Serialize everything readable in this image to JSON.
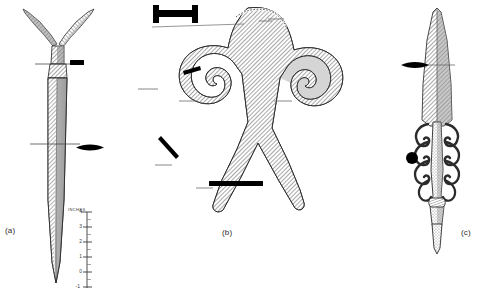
{
  "plate": {
    "title": "Archaeological artefact plate: antenna-hilted daggers",
    "background_color": "#ffffff",
    "ink_color": "#2b2b2b",
    "width": 477,
    "height": 297
  },
  "figures": [
    {
      "id": "a",
      "label": "(a)",
      "name": "antenna-hilted-dagger",
      "description": "Long tapering dagger blade with Y-shaped antenna hilt, hatched shading"
    },
    {
      "id": "b",
      "label": "(b)",
      "name": "double-spiral-antennae-hilt",
      "description": "Broad hilt plate with two inward volutes and two splayed tangs, hatched shading"
    },
    {
      "id": "c",
      "label": "(c)",
      "name": "openwork-ornate-dagger",
      "description": "Narrow blade with symmetrical openwork scroll ornament along the grip"
    }
  ],
  "cross_sections": [
    {
      "name": "rectangular-bar",
      "shape": "rectangle",
      "figure": "a",
      "note": "flat rectangular section at hilt junction"
    },
    {
      "name": "lenticular",
      "shape": "lens",
      "figure": "a",
      "note": "lens-shaped blade section"
    },
    {
      "name": "i-beam",
      "shape": "dumbbell",
      "figure": "b",
      "note": "I-shaped / dumbbell section of the hilt plate"
    },
    {
      "name": "short-angled-bar",
      "shape": "angled-bar",
      "figure": "b",
      "note": "thin angled bar section at volute"
    },
    {
      "name": "diagonal-bar",
      "shape": "diagonal-line",
      "figure": "b",
      "note": "slender diagonal section at tang"
    },
    {
      "name": "wide-flat-bar",
      "shape": "bar",
      "figure": "b",
      "note": "wide flat section across lower tang"
    },
    {
      "name": "lenticular",
      "shape": "lens",
      "figure": "c",
      "note": "lens-shaped blade section"
    },
    {
      "name": "circular",
      "shape": "circle",
      "figure": "c",
      "note": "round section of the grip"
    }
  ],
  "scale": {
    "title": "INCHES",
    "unit": "inches",
    "ticks": [
      "4",
      "3",
      "2",
      "1",
      "0",
      "-1"
    ],
    "orientation": "vertical",
    "direction": "descending"
  }
}
